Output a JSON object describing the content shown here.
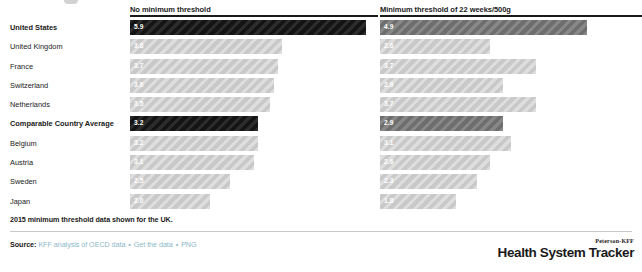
{
  "chart_data": {
    "type": "bar",
    "title": "",
    "xlabel": "",
    "ylabel": "",
    "orientation": "horizontal",
    "grid": false,
    "legend": "none",
    "xlim": [
      0,
      6.2
    ],
    "categories": [
      "United States",
      "United Kingdom",
      "France",
      "Switzerland",
      "Netherlands",
      "Comparable Country Average",
      "Belgium",
      "Austria",
      "Sweden",
      "Japan"
    ],
    "highlighted": [
      "United States",
      "Comparable Country Average"
    ],
    "series": [
      {
        "name": "No minimum threshold",
        "values": [
          5.9,
          3.8,
          3.7,
          3.6,
          3.5,
          3.2,
          3.2,
          3.1,
          2.5,
          2.0
        ]
      },
      {
        "name": "Minimum threshold of 22 weeks/500g",
        "values": [
          4.9,
          2.6,
          3.7,
          2.9,
          3.7,
          2.9,
          3.1,
          2.6,
          2.3,
          1.8
        ]
      }
    ],
    "annotations": [
      "2015 minimum threshold data shown for the UK."
    ]
  },
  "columns": {
    "left_header": "No minimum threshold",
    "right_header": "Minimum threshold of 22 weeks/500g"
  },
  "rows": [
    {
      "country": "United States",
      "left": "5.9",
      "right": "4.9"
    },
    {
      "country": "United Kingdom",
      "left": "3.8",
      "right": "2.6"
    },
    {
      "country": "France",
      "left": "3.7",
      "right": "3.7"
    },
    {
      "country": "Switzerland",
      "left": "3.6",
      "right": "2.9"
    },
    {
      "country": "Netherlands",
      "left": "3.5",
      "right": "3.7"
    },
    {
      "country": "Comparable Country Average",
      "left": "3.2",
      "right": "2.9"
    },
    {
      "country": "Belgium",
      "left": "3.2",
      "right": "3.1"
    },
    {
      "country": "Austria",
      "left": "3.1",
      "right": "2.6"
    },
    {
      "country": "Sweden",
      "left": "2.5",
      "right": "2.3"
    },
    {
      "country": "Japan",
      "left": "2.0",
      "right": "1.8"
    }
  ],
  "footnote": "2015 minimum threshold data shown for the UK.",
  "source": {
    "label": "Source:",
    "text": "KFF analysis of OECD data",
    "link_get_data": "Get the data",
    "link_png": "PNG",
    "separator": "•"
  },
  "logo": {
    "eyebrow": "Peterson-KFF",
    "wordmark": "Health System Tracker"
  },
  "colors": {
    "bar_default": "#c9c9c9",
    "bar_highlight_left": "#141414",
    "bar_highlight_right": "#6e6e6e",
    "link": "#8bb8c9",
    "text": "#1a1a1a"
  }
}
